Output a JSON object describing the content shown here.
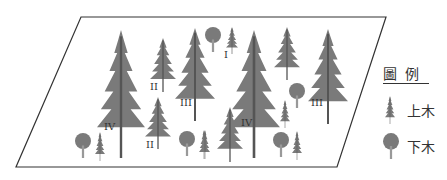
{
  "diagram": {
    "type": "forest-stand-layer-illustration",
    "plot_outline": "parallelogram",
    "colors": {
      "outline": "#333333",
      "tree": "#777777",
      "trunk": "#555555",
      "text": "#333333"
    },
    "crown_class_labels": [
      {
        "id": "IV-left",
        "text": "IV",
        "x": 104,
        "y": 130
      },
      {
        "id": "II-upper",
        "text": "II",
        "x": 150,
        "y": 90
      },
      {
        "id": "II-lower",
        "text": "II",
        "x": 146,
        "y": 148
      },
      {
        "id": "III-left",
        "text": "III",
        "x": 180,
        "y": 106
      },
      {
        "id": "I",
        "text": "I",
        "x": 224,
        "y": 58
      },
      {
        "id": "IV-right",
        "text": "IV",
        "x": 241,
        "y": 126
      },
      {
        "id": "III-right",
        "text": "III",
        "x": 311,
        "y": 106
      }
    ]
  },
  "legend": {
    "title": "圖例",
    "items": [
      {
        "icon": "conifer-tree-icon",
        "label": "上木"
      },
      {
        "icon": "broadleaf-tree-icon",
        "label": "下木"
      }
    ]
  }
}
